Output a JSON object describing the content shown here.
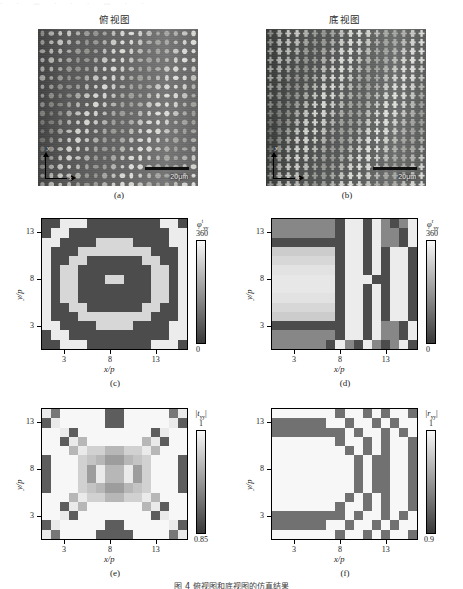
{
  "figure": {
    "caption": "图 4    俯视图和底视图的仿真结果",
    "top_bleed": "· · — · · · — · ·"
  },
  "sem_titles": {
    "left": "俯视图",
    "right": "底视图"
  },
  "panels": {
    "a": {
      "label": "(a)",
      "scalebar": "20μm",
      "axis_x": "x",
      "axis_y": "y"
    },
    "b": {
      "label": "(b)",
      "scalebar": "20μm",
      "axis_x": "x",
      "axis_y": "y"
    },
    "c": {
      "label": "(c)"
    },
    "d": {
      "label": "(d)"
    },
    "e": {
      "label": "(e)"
    },
    "f": {
      "label": "(f)"
    }
  },
  "axes": {
    "xlabel": "x/p",
    "ylabel": "y/p",
    "xticks": [
      "3",
      "8",
      "13"
    ],
    "yticks": [
      "3",
      "8",
      "13"
    ]
  },
  "colorbars": {
    "c": {
      "name_base": "φ",
      "name_sub": "yy",
      "name_sup": "t",
      "max": "360",
      "min": "0"
    },
    "d": {
      "name_base": "φ",
      "name_sub": "yy",
      "name_sup": "r",
      "max": "360",
      "min": "0"
    },
    "e": {
      "name_base": "|t",
      "name_sub": "yy",
      "name_tail": "|",
      "max": "1",
      "min": "0.85"
    },
    "f": {
      "name_base": "|r",
      "name_sub": "yy",
      "name_tail": "|",
      "max": "1",
      "min": "0.9"
    }
  },
  "chart_data": [
    {
      "id": "c",
      "type": "heatmap",
      "title": "",
      "xlabel": "x/p",
      "ylabel": "y/p",
      "zlabel": "phi_yy^t (deg)",
      "xlim": [
        1,
        16
      ],
      "ylim": [
        1,
        14
      ],
      "zlim": [
        0,
        360
      ],
      "nx": 16,
      "ny": 14,
      "colormap": "grayscale",
      "xtick_values": [
        3,
        8,
        13
      ],
      "ytick_values": [
        3,
        8,
        13
      ],
      "description": "Transmission phase map of metasurface: concentric rectangular Fresnel-like rings, bright (360) rings alternating with dark (0) rings, single bright pixel at the centre (8,8).",
      "values": [
        [
          40,
          40,
          340,
          340,
          340,
          40,
          40,
          40,
          40,
          40,
          40,
          40,
          40,
          340,
          340,
          40
        ],
        [
          40,
          340,
          340,
          40,
          40,
          40,
          40,
          40,
          40,
          40,
          40,
          40,
          40,
          40,
          340,
          340
        ],
        [
          340,
          340,
          40,
          40,
          40,
          40,
          300,
          300,
          300,
          300,
          40,
          40,
          40,
          40,
          340,
          340
        ],
        [
          340,
          40,
          40,
          40,
          300,
          300,
          300,
          300,
          300,
          300,
          300,
          300,
          40,
          40,
          40,
          340
        ],
        [
          340,
          40,
          40,
          300,
          300,
          40,
          40,
          40,
          40,
          40,
          40,
          300,
          300,
          40,
          40,
          340
        ],
        [
          340,
          40,
          300,
          300,
          40,
          40,
          40,
          40,
          40,
          40,
          40,
          40,
          300,
          300,
          40,
          340
        ],
        [
          340,
          40,
          300,
          300,
          40,
          40,
          40,
          300,
          300,
          40,
          40,
          40,
          300,
          300,
          40,
          340
        ],
        [
          340,
          40,
          300,
          300,
          40,
          40,
          40,
          40,
          40,
          40,
          40,
          40,
          300,
          300,
          40,
          340
        ],
        [
          340,
          40,
          300,
          300,
          40,
          40,
          40,
          40,
          40,
          40,
          40,
          40,
          300,
          300,
          40,
          340
        ],
        [
          340,
          40,
          40,
          300,
          300,
          40,
          40,
          40,
          40,
          40,
          40,
          300,
          300,
          40,
          40,
          340
        ],
        [
          340,
          40,
          40,
          40,
          300,
          300,
          300,
          300,
          300,
          300,
          300,
          300,
          40,
          40,
          40,
          340
        ],
        [
          340,
          340,
          40,
          40,
          40,
          40,
          300,
          300,
          300,
          300,
          40,
          40,
          40,
          40,
          340,
          340
        ],
        [
          40,
          340,
          340,
          40,
          40,
          40,
          40,
          40,
          40,
          40,
          40,
          40,
          40,
          40,
          340,
          340
        ],
        [
          40,
          40,
          340,
          340,
          340,
          40,
          40,
          40,
          40,
          40,
          40,
          40,
          340,
          340,
          340,
          40
        ]
      ]
    },
    {
      "id": "d",
      "type": "heatmap",
      "title": "",
      "xlabel": "x/p",
      "ylabel": "y/p",
      "zlabel": "phi_yy^r (deg)",
      "xlim": [
        1,
        16
      ],
      "ylim": [
        1,
        14
      ],
      "zlim": [
        0,
        360
      ],
      "nx": 16,
      "ny": 14,
      "colormap": "grayscale",
      "xtick_values": [
        3,
        8,
        13
      ],
      "ytick_values": [
        3,
        8,
        13
      ],
      "description": "Reflection phase map: broad bright plateau on the left half, breaking into vertical stripes of alternating dark/bright towards the right edge.",
      "values": [
        [
          150,
          150,
          150,
          150,
          150,
          150,
          150,
          40,
          340,
          340,
          40,
          340,
          150,
          40,
          150,
          340
        ],
        [
          150,
          150,
          150,
          150,
          150,
          150,
          150,
          40,
          340,
          340,
          40,
          340,
          150,
          150,
          40,
          340
        ],
        [
          40,
          40,
          40,
          40,
          40,
          40,
          40,
          40,
          340,
          340,
          40,
          340,
          150,
          150,
          40,
          340
        ],
        [
          280,
          280,
          280,
          280,
          280,
          280,
          280,
          40,
          340,
          340,
          40,
          340,
          40,
          340,
          340,
          40
        ],
        [
          300,
          300,
          300,
          300,
          300,
          300,
          300,
          40,
          340,
          340,
          40,
          340,
          40,
          340,
          340,
          40
        ],
        [
          320,
          320,
          320,
          320,
          320,
          320,
          320,
          40,
          340,
          340,
          40,
          340,
          40,
          340,
          340,
          40
        ],
        [
          330,
          330,
          330,
          330,
          330,
          330,
          330,
          40,
          340,
          340,
          340,
          40,
          40,
          340,
          340,
          40
        ],
        [
          330,
          330,
          330,
          330,
          330,
          330,
          330,
          40,
          340,
          340,
          40,
          340,
          40,
          340,
          340,
          40
        ],
        [
          320,
          320,
          320,
          320,
          320,
          320,
          320,
          40,
          340,
          340,
          40,
          340,
          40,
          340,
          340,
          40
        ],
        [
          300,
          300,
          300,
          300,
          300,
          300,
          300,
          40,
          340,
          340,
          40,
          340,
          40,
          340,
          340,
          40
        ],
        [
          280,
          280,
          280,
          280,
          280,
          280,
          280,
          40,
          340,
          340,
          40,
          340,
          40,
          340,
          340,
          40
        ],
        [
          40,
          40,
          40,
          40,
          40,
          40,
          40,
          40,
          340,
          340,
          40,
          340,
          150,
          150,
          40,
          340
        ],
        [
          150,
          150,
          150,
          150,
          150,
          150,
          150,
          40,
          340,
          340,
          40,
          340,
          150,
          150,
          40,
          340
        ],
        [
          150,
          150,
          150,
          150,
          150,
          150,
          40,
          340,
          150,
          40,
          340,
          150,
          40,
          150,
          340,
          40
        ]
      ]
    },
    {
      "id": "e",
      "type": "heatmap",
      "title": "",
      "xlabel": "x/p",
      "ylabel": "y/p",
      "zlabel": "|t_yy|",
      "xlim": [
        1,
        16
      ],
      "ylim": [
        1,
        14
      ],
      "zlim": [
        0.85,
        1.0
      ],
      "nx": 16,
      "ny": 14,
      "colormap": "grayscale",
      "xtick_values": [
        3,
        8,
        13
      ],
      "ytick_values": [
        3,
        8,
        13
      ],
      "description": "Transmission amplitude map: mostly near unity (white) with scattered darker (0.88-0.92) pixels forming a symmetric ring pattern, plus dark blocks at the four corners and edge midpoints.",
      "values": [
        [
          0.99,
          0.9,
          1.0,
          1.0,
          1.0,
          1.0,
          1.0,
          0.88,
          0.88,
          1.0,
          1.0,
          1.0,
          1.0,
          1.0,
          0.9,
          0.99
        ],
        [
          0.88,
          0.99,
          1.0,
          1.0,
          1.0,
          1.0,
          1.0,
          0.88,
          0.88,
          1.0,
          1.0,
          1.0,
          1.0,
          1.0,
          0.99,
          0.88
        ],
        [
          1.0,
          1.0,
          0.99,
          0.88,
          1.0,
          1.0,
          1.0,
          1.0,
          1.0,
          1.0,
          1.0,
          1.0,
          0.88,
          0.99,
          1.0,
          1.0
        ],
        [
          1.0,
          1.0,
          0.88,
          0.99,
          0.95,
          1.0,
          1.0,
          1.0,
          1.0,
          1.0,
          1.0,
          0.95,
          0.99,
          0.88,
          1.0,
          1.0
        ],
        [
          1.0,
          1.0,
          1.0,
          0.95,
          0.99,
          0.97,
          0.97,
          0.95,
          0.95,
          0.97,
          0.97,
          0.99,
          0.95,
          1.0,
          1.0,
          1.0
        ],
        [
          0.88,
          1.0,
          1.0,
          1.0,
          0.97,
          0.96,
          0.95,
          0.93,
          0.93,
          0.95,
          0.96,
          0.97,
          1.0,
          1.0,
          1.0,
          0.88
        ],
        [
          0.88,
          1.0,
          1.0,
          1.0,
          0.97,
          0.93,
          0.99,
          0.95,
          0.95,
          0.99,
          0.93,
          0.97,
          1.0,
          1.0,
          1.0,
          0.88
        ],
        [
          0.88,
          1.0,
          1.0,
          1.0,
          0.97,
          0.93,
          0.99,
          0.95,
          0.95,
          0.99,
          0.93,
          0.97,
          1.0,
          1.0,
          1.0,
          0.88
        ],
        [
          0.88,
          1.0,
          1.0,
          1.0,
          0.97,
          0.96,
          0.95,
          0.93,
          0.93,
          0.95,
          0.96,
          0.97,
          1.0,
          1.0,
          1.0,
          0.88
        ],
        [
          1.0,
          1.0,
          1.0,
          0.95,
          0.99,
          0.97,
          0.97,
          0.95,
          0.95,
          0.97,
          0.97,
          0.99,
          0.95,
          1.0,
          1.0,
          1.0
        ],
        [
          1.0,
          1.0,
          0.88,
          0.99,
          0.95,
          1.0,
          1.0,
          1.0,
          1.0,
          1.0,
          1.0,
          0.95,
          0.99,
          0.88,
          1.0,
          1.0
        ],
        [
          1.0,
          1.0,
          0.99,
          0.88,
          1.0,
          1.0,
          1.0,
          1.0,
          1.0,
          1.0,
          1.0,
          1.0,
          0.88,
          0.99,
          1.0,
          1.0
        ],
        [
          0.88,
          0.99,
          1.0,
          1.0,
          1.0,
          1.0,
          1.0,
          0.88,
          0.88,
          1.0,
          1.0,
          1.0,
          1.0,
          1.0,
          0.99,
          0.88
        ],
        [
          0.99,
          0.9,
          1.0,
          1.0,
          1.0,
          1.0,
          0.88,
          0.88,
          0.88,
          0.88,
          1.0,
          1.0,
          1.0,
          1.0,
          0.9,
          0.99
        ]
      ]
    },
    {
      "id": "f",
      "type": "heatmap",
      "title": "",
      "xlabel": "x/p",
      "ylabel": "y/p",
      "zlabel": "|r_yy|",
      "xlim": [
        1,
        16
      ],
      "ylim": [
        1,
        14
      ],
      "zlim": [
        0.9,
        1.0
      ],
      "nx": 16,
      "ny": 14,
      "colormap": "grayscale",
      "xtick_values": [
        3,
        8,
        13
      ],
      "ytick_values": [
        3,
        8,
        13
      ],
      "description": "Reflection amplitude map: large white (near 1) plateau on the left, darker (0.93) bands outlining it and vertical dark stripes on the right half.",
      "values": [
        [
          1.0,
          1.0,
          1.0,
          1.0,
          1.0,
          1.0,
          1.0,
          0.93,
          1.0,
          1.0,
          0.93,
          1.0,
          0.93,
          1.0,
          1.0,
          0.93
        ],
        [
          0.93,
          0.93,
          0.93,
          0.93,
          0.93,
          0.93,
          1.0,
          1.0,
          0.93,
          1.0,
          1.0,
          0.93,
          1.0,
          0.93,
          1.0,
          1.0
        ],
        [
          0.93,
          0.93,
          0.93,
          0.93,
          0.93,
          0.93,
          0.93,
          0.93,
          1.0,
          0.93,
          1.0,
          1.0,
          0.93,
          1.0,
          0.93,
          1.0
        ],
        [
          1.0,
          1.0,
          1.0,
          1.0,
          1.0,
          1.0,
          1.0,
          0.93,
          1.0,
          1.0,
          0.93,
          1.0,
          0.93,
          1.0,
          1.0,
          0.93
        ],
        [
          1.0,
          1.0,
          1.0,
          1.0,
          1.0,
          1.0,
          1.0,
          1.0,
          0.93,
          1.0,
          0.93,
          1.0,
          0.93,
          1.0,
          1.0,
          0.93
        ],
        [
          1.0,
          1.0,
          1.0,
          1.0,
          1.0,
          1.0,
          1.0,
          1.0,
          1.0,
          0.93,
          1.0,
          0.93,
          0.93,
          1.0,
          1.0,
          0.93
        ],
        [
          1.0,
          1.0,
          1.0,
          1.0,
          1.0,
          1.0,
          1.0,
          1.0,
          1.0,
          0.93,
          1.0,
          0.93,
          0.93,
          1.0,
          1.0,
          0.93
        ],
        [
          1.0,
          1.0,
          1.0,
          1.0,
          1.0,
          1.0,
          1.0,
          1.0,
          1.0,
          0.93,
          1.0,
          0.93,
          0.93,
          1.0,
          1.0,
          0.93
        ],
        [
          1.0,
          1.0,
          1.0,
          1.0,
          1.0,
          1.0,
          1.0,
          1.0,
          1.0,
          0.93,
          1.0,
          0.93,
          0.93,
          1.0,
          1.0,
          0.93
        ],
        [
          1.0,
          1.0,
          1.0,
          1.0,
          1.0,
          1.0,
          1.0,
          1.0,
          0.93,
          1.0,
          0.93,
          1.0,
          0.93,
          1.0,
          1.0,
          0.93
        ],
        [
          1.0,
          1.0,
          1.0,
          1.0,
          1.0,
          1.0,
          1.0,
          0.93,
          1.0,
          1.0,
          0.93,
          1.0,
          0.93,
          1.0,
          1.0,
          0.93
        ],
        [
          0.93,
          0.93,
          0.93,
          0.93,
          0.93,
          0.93,
          0.93,
          0.93,
          1.0,
          0.93,
          1.0,
          1.0,
          0.93,
          1.0,
          0.93,
          1.0
        ],
        [
          0.93,
          0.93,
          0.93,
          0.93,
          0.93,
          0.93,
          1.0,
          1.0,
          0.93,
          1.0,
          1.0,
          0.93,
          1.0,
          0.93,
          1.0,
          1.0
        ],
        [
          1.0,
          1.0,
          1.0,
          1.0,
          1.0,
          1.0,
          1.0,
          0.93,
          1.0,
          1.0,
          0.93,
          1.0,
          0.93,
          1.0,
          1.0,
          0.93
        ]
      ]
    }
  ]
}
